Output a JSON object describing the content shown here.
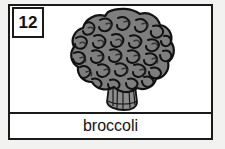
{
  "card": {
    "number": "12",
    "label": "broccoli",
    "illustration": "broccoli-illustration",
    "colors": {
      "page_background": "#f2f2f0",
      "card_background": "#ffffff",
      "frame": "#1a1a1a",
      "outline": "#121212",
      "floret_fill": "#7e7e7e",
      "floret_shadow": "#6a6a6a",
      "stalk_fill": "#8d8d8d",
      "stalk_line": "#1a1a1a",
      "text": "#141414"
    }
  }
}
